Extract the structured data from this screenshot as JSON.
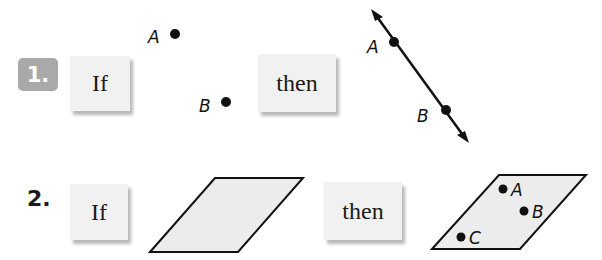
{
  "problems": [
    {
      "number": "1.",
      "if_label": "If",
      "then_label": "then",
      "if_figure": {
        "type": "two-points",
        "points": [
          "A",
          "B"
        ]
      },
      "then_figure": {
        "type": "line-through-points",
        "points": [
          "A",
          "B"
        ]
      }
    },
    {
      "number": "2.",
      "if_label": "If",
      "then_label": "then",
      "if_figure": {
        "type": "plane"
      },
      "then_figure": {
        "type": "plane-with-points",
        "points": [
          "A",
          "B",
          "C"
        ]
      }
    }
  ],
  "colors": {
    "badge_bg": "#a9a9a9",
    "card_bg": "#f1f1f1",
    "plane_fill": "#ececec",
    "ink": "#111111"
  }
}
